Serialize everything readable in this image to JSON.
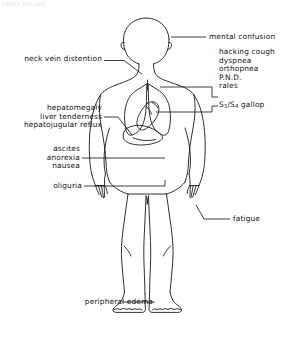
{
  "figure": {
    "title_artifact": "HEART FAILURE",
    "organs": [
      "head",
      "neck",
      "lungs",
      "heart",
      "liver",
      "arms",
      "legs",
      "feet"
    ]
  },
  "labels": {
    "mental_confusion": "mental confusion",
    "neck_vein_distention": "neck vein distention",
    "pulmonary": {
      "line1": "hacking cough",
      "line2": "dyspnea",
      "line3": "orthopnea",
      "line4": "P.N.D.",
      "line5": "rales"
    },
    "gallop_prefix": "S",
    "gallop_sub1": "3",
    "gallop_slash": "/S",
    "gallop_sub2": "4",
    "gallop_suffix": " gallop",
    "hepatic": {
      "line1": "hepatomegaly",
      "line2": "liver tenderness",
      "line3": "hepatojugular reflux"
    },
    "abdominal": {
      "line1": "ascites",
      "line2": "anorexia",
      "line3": "nausea"
    },
    "oliguria": "oliguria",
    "fatigue": "fatigue",
    "peripheral_edema": "peripheral edema"
  },
  "colors": {
    "stroke": "#1a1a1a",
    "text": "#111111",
    "background": "#ffffff"
  }
}
